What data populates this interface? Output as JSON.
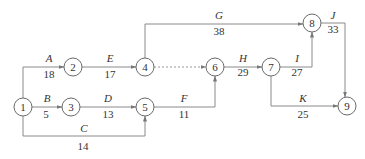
{
  "diagram": {
    "type": "activity-on-arrow network",
    "nodes": [
      {
        "id": "1",
        "x": 23,
        "y": 107
      },
      {
        "id": "2",
        "x": 73,
        "y": 67
      },
      {
        "id": "3",
        "x": 71,
        "y": 107
      },
      {
        "id": "4",
        "x": 145,
        "y": 67
      },
      {
        "id": "5",
        "x": 145,
        "y": 107
      },
      {
        "id": "6",
        "x": 215,
        "y": 67
      },
      {
        "id": "7",
        "x": 271,
        "y": 67
      },
      {
        "id": "8",
        "x": 312,
        "y": 23
      },
      {
        "id": "9",
        "x": 347,
        "y": 106
      }
    ],
    "activities": [
      {
        "name": "A",
        "duration": "18",
        "from": "1",
        "to": "2"
      },
      {
        "name": "B",
        "duration": "5",
        "from": "1",
        "to": "3"
      },
      {
        "name": "C",
        "duration": "14",
        "from": "1",
        "to": "5"
      },
      {
        "name": "D",
        "duration": "13",
        "from": "3",
        "to": "5"
      },
      {
        "name": "E",
        "duration": "17",
        "from": "2",
        "to": "4"
      },
      {
        "name": "F",
        "duration": "11",
        "from": "5",
        "to": "6"
      },
      {
        "name": "G",
        "duration": "38",
        "from": "4",
        "to": "8"
      },
      {
        "name": "H",
        "duration": "29",
        "from": "6",
        "to": "7"
      },
      {
        "name": "I",
        "duration": "27",
        "from": "7",
        "to": "8"
      },
      {
        "name": "J",
        "duration": "33",
        "from": "8",
        "to": "9"
      },
      {
        "name": "K",
        "duration": "25",
        "from": "7",
        "to": "9"
      }
    ],
    "dummy_activities": [
      {
        "from": "4",
        "to": "6"
      }
    ]
  }
}
